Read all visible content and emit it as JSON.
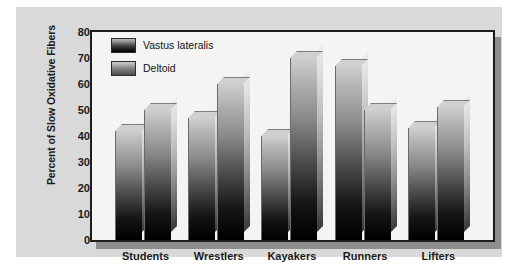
{
  "chart_data": {
    "type": "bar",
    "title": "",
    "subtitle": "",
    "xlabel": "",
    "ylabel": "Percent of Slow Oxidative Fibers",
    "categories": [
      "Students",
      "Wrestlers",
      "Kayakers",
      "Runners",
      "Lifters"
    ],
    "series": [
      {
        "name": "Vastus lateralis",
        "values": [
          42,
          47,
          40,
          67,
          43
        ]
      },
      {
        "name": "Deltoid",
        "values": [
          50,
          60,
          70,
          50,
          51
        ]
      }
    ],
    "ylim": [
      0,
      80
    ],
    "ytick_labels": [
      "80",
      "70",
      "60",
      "50",
      "40",
      "30",
      "20",
      "10",
      "0"
    ],
    "ytick_values": [
      80,
      70,
      60,
      50,
      40,
      30,
      20,
      10,
      0
    ],
    "ytick_step": 10,
    "grid": false,
    "legend_position": "upper-left-inside",
    "bar_style": "3d-extruded-gradient",
    "colors": {
      "panel_background": "#d9d9d9",
      "plot_background": "#f4f4f2",
      "plot_border": "#1c1c1c",
      "plot_shadow": "#8d8d8d",
      "bar_gradient_top": "#cfcfcf",
      "bar_gradient_bottom": "#000000",
      "bar_side_face": "#bdbdbd",
      "text": "#1a1a1a",
      "page_background": "#ffffff"
    }
  }
}
